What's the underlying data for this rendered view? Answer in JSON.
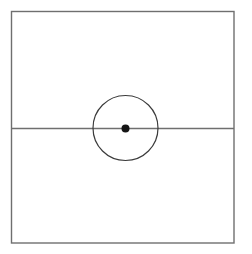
{
  "figure": {
    "title": "",
    "canvas": {
      "width": 252,
      "height": 254,
      "background_color": "#ffffff"
    },
    "shapes": {
      "frame": {
        "label": "rectangle-frame",
        "x": 11.5,
        "y": 11.5,
        "width": 222.5,
        "height": 231.5,
        "stroke_color": "#6f6f6f",
        "stroke_width": 1.4,
        "fill": "none"
      },
      "horizontal_line": {
        "label": "horizontal-axis-line",
        "x1": 11.5,
        "y1": 128.5,
        "x2": 234,
        "y2": 128.5,
        "stroke_color": "#6f6f6f",
        "stroke_width": 1.4
      },
      "circle": {
        "label": "circle-outline",
        "cx": 125.5,
        "cy": 128,
        "r": 32.5,
        "stroke_color": "#3b3b3b",
        "stroke_width": 1.2,
        "fill": "none"
      },
      "center_dot": {
        "label": "center-point-dot",
        "cx": 125.5,
        "cy": 128.5,
        "r": 4,
        "fill_color": "#151515"
      }
    }
  }
}
